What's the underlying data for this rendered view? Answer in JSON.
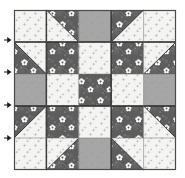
{
  "figure": {
    "kind": "quilt-block-diagram",
    "grid_rows": 5,
    "grid_cols": 5,
    "frame": {
      "x": 14,
      "y": 10,
      "width": 162,
      "height": 160,
      "border_color": "#4a4a4a"
    },
    "background": "#ffffff"
  },
  "fabrics": {
    "light": {
      "name": "light-print",
      "base": "#f4f4f2",
      "motif": "#b9b9b9",
      "label": "Light background print"
    },
    "dark": {
      "name": "dark-floral",
      "base": "#5d5d5d",
      "motif": "#ffffff",
      "label": "Dark floral print"
    },
    "gray": {
      "name": "solid-gray",
      "base": "#a6a6a6",
      "motif": "#8a8a8a",
      "label": "Medium gray solid"
    }
  },
  "cells": [
    {
      "r": 0,
      "c": 0,
      "type": "solid",
      "fabric": "light"
    },
    {
      "r": 0,
      "c": 1,
      "type": "hst",
      "fabric": "light",
      "fabric2": "dark",
      "corner": "top-right"
    },
    {
      "r": 0,
      "c": 2,
      "type": "solid",
      "fabric": "gray"
    },
    {
      "r": 0,
      "c": 3,
      "type": "hst",
      "fabric": "light",
      "fabric2": "dark",
      "corner": "top-left"
    },
    {
      "r": 0,
      "c": 4,
      "type": "solid",
      "fabric": "light"
    },
    {
      "r": 1,
      "c": 0,
      "type": "hst",
      "fabric": "light",
      "fabric2": "dark",
      "corner": "bottom-left"
    },
    {
      "r": 1,
      "c": 1,
      "type": "solid",
      "fabric": "dark"
    },
    {
      "r": 1,
      "c": 2,
      "type": "solid",
      "fabric": "light"
    },
    {
      "r": 1,
      "c": 3,
      "type": "solid",
      "fabric": "dark"
    },
    {
      "r": 1,
      "c": 4,
      "type": "hst",
      "fabric": "light",
      "fabric2": "dark",
      "corner": "bottom-right"
    },
    {
      "r": 2,
      "c": 0,
      "type": "solid",
      "fabric": "gray"
    },
    {
      "r": 2,
      "c": 1,
      "type": "solid",
      "fabric": "light"
    },
    {
      "r": 2,
      "c": 2,
      "type": "solid",
      "fabric": "dark"
    },
    {
      "r": 2,
      "c": 3,
      "type": "solid",
      "fabric": "light"
    },
    {
      "r": 2,
      "c": 4,
      "type": "solid",
      "fabric": "gray"
    },
    {
      "r": 3,
      "c": 0,
      "type": "hst",
      "fabric": "light",
      "fabric2": "dark",
      "corner": "top-left"
    },
    {
      "r": 3,
      "c": 1,
      "type": "solid",
      "fabric": "dark"
    },
    {
      "r": 3,
      "c": 2,
      "type": "solid",
      "fabric": "light"
    },
    {
      "r": 3,
      "c": 3,
      "type": "solid",
      "fabric": "dark"
    },
    {
      "r": 3,
      "c": 4,
      "type": "hst",
      "fabric": "light",
      "fabric2": "dark",
      "corner": "top-right"
    },
    {
      "r": 4,
      "c": 0,
      "type": "solid",
      "fabric": "light"
    },
    {
      "r": 4,
      "c": 1,
      "type": "hst",
      "fabric": "light",
      "fabric2": "dark",
      "corner": "bottom-right"
    },
    {
      "r": 4,
      "c": 2,
      "type": "solid",
      "fabric": "gray"
    },
    {
      "r": 4,
      "c": 3,
      "type": "hst",
      "fabric": "light",
      "fabric2": "dark",
      "corner": "bottom-left"
    },
    {
      "r": 4,
      "c": 4,
      "type": "solid",
      "fabric": "light"
    }
  ],
  "seam_arrows": [
    {
      "name": "seam-arrow-1",
      "x": 4,
      "y": 40,
      "direction": "right"
    },
    {
      "name": "seam-arrow-2",
      "x": 4,
      "y": 72,
      "direction": "right"
    },
    {
      "name": "seam-arrow-3",
      "x": 4,
      "y": 105,
      "direction": "right"
    },
    {
      "name": "seam-arrow-4",
      "x": 4,
      "y": 138,
      "direction": "right"
    }
  ],
  "seam_lines": {
    "color": "#1a1a1a",
    "width": 1.4,
    "rows": [
      1,
      3
    ],
    "cols": [
      1,
      3
    ]
  }
}
